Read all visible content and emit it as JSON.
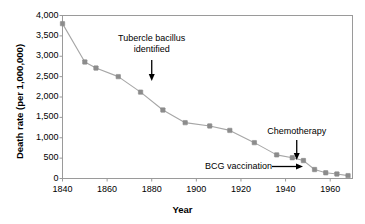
{
  "chart_data": {
    "type": "line",
    "title": "",
    "xlabel": "Year",
    "ylabel": "Death rate (per 1,000,000)",
    "xlim": [
      1840,
      1970
    ],
    "ylim": [
      0,
      4000
    ],
    "grid": false,
    "legend": "none",
    "xticks": [
      1840,
      1860,
      1880,
      1900,
      1920,
      1940,
      1960
    ],
    "yticks": [
      0,
      500,
      1000,
      1500,
      2000,
      2500,
      3000,
      3500,
      4000
    ],
    "ytick_labels": [
      "0",
      "500",
      "1,000",
      "1,500",
      "2,000",
      "2,500",
      "3,000",
      "3,500",
      "4,000"
    ],
    "xtick_labels": [
      "1840",
      "1860",
      "1880",
      "1900",
      "1920",
      "1940",
      "1960"
    ],
    "series": [
      {
        "name": "Tuberculosis death rate",
        "marker": "square",
        "marker_color": "#8c8c8c",
        "line_color": "#a6a6a6",
        "x": [
          1840,
          1850,
          1855,
          1865,
          1875,
          1885,
          1895,
          1906,
          1915,
          1926,
          1936,
          1943,
          1948,
          1953,
          1958,
          1963,
          1968
        ],
        "values": [
          3800,
          2860,
          2710,
          2500,
          2120,
          1680,
          1370,
          1290,
          1180,
          880,
          580,
          510,
          440,
          220,
          140,
          110,
          70
        ]
      }
    ],
    "annotations": [
      {
        "id": "tubercle-bacillus",
        "text_lines": [
          "Tubercle bacillus",
          "identified"
        ],
        "arrow": "down",
        "target_x": 1880,
        "target_y": 2200
      },
      {
        "id": "chemotherapy",
        "text_lines": [
          "Chemotherapy"
        ],
        "arrow": "down",
        "target_x": 1945,
        "target_y": 560
      },
      {
        "id": "bcg-vaccination",
        "text_lines": [
          "BCG vaccination"
        ],
        "arrow": "right",
        "target_x": 1951,
        "target_y": 230
      }
    ]
  },
  "axes": {
    "y_title": "Death rate (per 1,000,000)",
    "x_title": "Year"
  },
  "annotation_text": {
    "tubercle_line1": "Tubercle bacillus",
    "tubercle_line2": "identified",
    "chemotherapy": "Chemotherapy",
    "bcg": "BCG vaccination"
  },
  "colors": {
    "line": "#a6a6a6",
    "marker": "#8c8c8c",
    "axis": "#9a9a9a",
    "text": "#000000"
  }
}
